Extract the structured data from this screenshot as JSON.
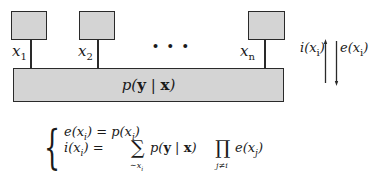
{
  "diagram": {
    "variables": [
      {
        "name": "x",
        "subscript": "1"
      },
      {
        "name": "x",
        "subscript": "2"
      },
      {
        "name": "x",
        "subscript": "n"
      }
    ],
    "ellipsis": "• • •",
    "factor_label": {
      "p": "p(",
      "y": "y",
      "bar": " | ",
      "x": "x",
      "close": ")"
    },
    "arrows": {
      "up_label": {
        "f": "i(x",
        "sub": "i",
        "close": ")"
      },
      "down_label": {
        "f": "e(x",
        "sub": "i",
        "close": ")"
      }
    },
    "colors": {
      "box_fill": "#d4d4d4",
      "stroke": "#2a2a2a"
    }
  },
  "equations": {
    "line1": {
      "lhs": "e(x",
      "lhs_sub": "i",
      "lhs_close": ") = p(x",
      "rhs_sub": "i",
      "rhs_close": ")"
    },
    "line2": {
      "lhs": "i(x",
      "lhs_sub": "i",
      "lhs_close": ") =",
      "sum_symbol": "∑",
      "sum_under": "∼x",
      "sum_under_sub": "i",
      "term": "p(",
      "term_y": "y",
      "term_bar": " | ",
      "term_x": "x",
      "term_close": ")",
      "prod_symbol": "∏",
      "prod_under": "j≠i",
      "tail": "e(x",
      "tail_sub": "j",
      "tail_close": ")"
    }
  }
}
